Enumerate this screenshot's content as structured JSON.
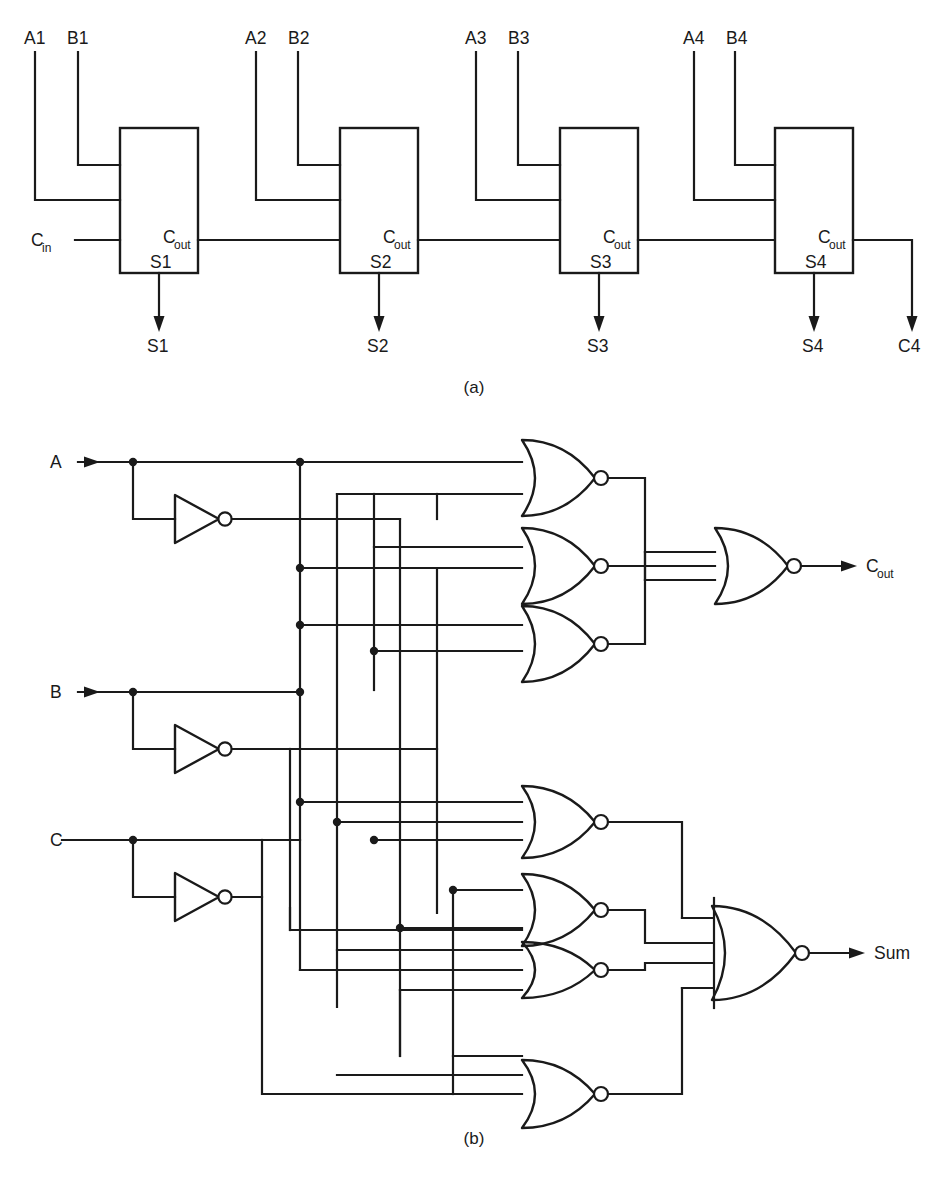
{
  "figure": {
    "title_sub_a": "(a)",
    "title_sub_b": "(b)",
    "footnote": "",
    "ink_color": "#1a1a1a",
    "background_color": "#ffffff"
  },
  "part_a": {
    "name": "4-bit ripple carry adder block diagram",
    "caption": "(a)",
    "carry_in_label": "C",
    "carry_in_sub": "in",
    "carry_out_label": "C",
    "carry_out_sub": "out",
    "final_carry_label": "C4",
    "stages": [
      {
        "a_label": "A1",
        "b_label": "B1",
        "sum_internal_label": "S1",
        "sum_output_label": "S1",
        "carry_out_label": "C",
        "carry_out_sub": "out"
      },
      {
        "a_label": "A2",
        "b_label": "B2",
        "sum_internal_label": "S2",
        "sum_output_label": "S2",
        "carry_out_label": "C",
        "carry_out_sub": "out"
      },
      {
        "a_label": "A3",
        "b_label": "B3",
        "sum_internal_label": "S3",
        "sum_output_label": "S3",
        "carry_out_label": "C",
        "carry_out_sub": "out"
      },
      {
        "a_label": "A4",
        "b_label": "B4",
        "sum_internal_label": "S4",
        "sum_output_label": "S4",
        "carry_out_label": "C",
        "carry_out_sub": "out"
      }
    ]
  },
  "part_b": {
    "name": "Full adder gate level schematic using NOR gates and inverters",
    "caption": "(b)",
    "inputs": [
      {
        "label": "A"
      },
      {
        "label": "B"
      },
      {
        "label": "C"
      }
    ],
    "inverters": [
      {
        "name": "inverter-a",
        "input": "A",
        "output": "A-bar"
      },
      {
        "name": "inverter-b",
        "input": "B",
        "output": "B-bar"
      },
      {
        "name": "inverter-c",
        "input": "C",
        "output": "C-bar"
      }
    ],
    "carry_gates": [
      {
        "name": "nor-carry-1",
        "inputs": 2
      },
      {
        "name": "nor-carry-2",
        "inputs": 2
      },
      {
        "name": "nor-carry-3",
        "inputs": 2
      }
    ],
    "sum_gates": [
      {
        "name": "nor-sum-1",
        "inputs": 3
      },
      {
        "name": "nor-sum-2",
        "inputs": 3
      },
      {
        "name": "nor-sum-3",
        "inputs": 3
      },
      {
        "name": "nor-sum-4",
        "inputs": 3
      }
    ],
    "output_gates": [
      {
        "name": "nor-carry-out",
        "inputs": 3,
        "label": "C",
        "sub": "out"
      },
      {
        "name": "nor-sum-out",
        "inputs": 4,
        "label": "Sum",
        "sub": ""
      }
    ],
    "outputs": [
      {
        "label": "C",
        "sub": "out"
      },
      {
        "label": "Sum",
        "sub": ""
      }
    ]
  }
}
